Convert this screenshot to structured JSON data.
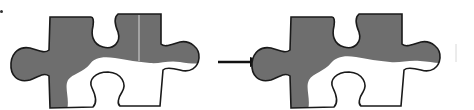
{
  "figure": {
    "colors": {
      "fill": "#6e6e6e",
      "outline": "#1a1a1a",
      "background": "#ffffff",
      "arrow": "#111111"
    },
    "pieces": [
      {
        "id": "before",
        "label": ""
      },
      {
        "id": "after",
        "label": ""
      }
    ],
    "arrow": {
      "direction": "right",
      "label": ""
    }
  }
}
